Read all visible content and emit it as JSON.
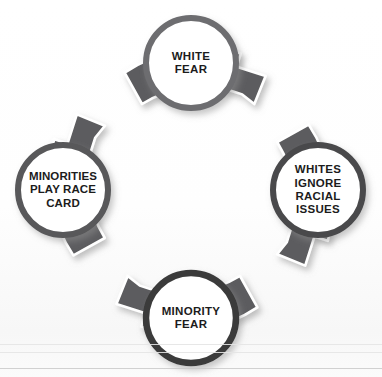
{
  "diagram": {
    "type": "cycle",
    "direction": "clockwise",
    "title": "",
    "colors": {
      "arrow_fill": "#5c5c5e",
      "arrow_outline": "#ffffff",
      "circle_ring": "#6a6a6c",
      "circle_ring_dark": "#3b3b3b",
      "circle_fill": "#ffffff",
      "text": "#1c1c1c",
      "background": "#ffffff",
      "scan_rule": "#c9c9c9"
    },
    "nodes": [
      {
        "id": "white-fear",
        "position": "top",
        "lines": [
          "WHITE",
          "FEAR"
        ]
      },
      {
        "id": "whites-ignore-racial-issues",
        "position": "right",
        "lines": [
          "WHITES",
          "IGNORE",
          "RACIAL",
          "ISSUES"
        ]
      },
      {
        "id": "minority-fear",
        "position": "bottom",
        "lines": [
          "MINORITY",
          "FEAR"
        ]
      },
      {
        "id": "minorities-play-race-card",
        "position": "left",
        "lines": [
          "MINORITIES",
          "PLAY RACE",
          "CARD"
        ]
      }
    ],
    "arrows": [
      {
        "id": "arrow-top-to-right",
        "from": "white-fear",
        "to": "whites-ignore-racial-issues"
      },
      {
        "id": "arrow-right-to-bottom",
        "from": "whites-ignore-racial-issues",
        "to": "minority-fear"
      },
      {
        "id": "arrow-bottom-to-left",
        "from": "minority-fear",
        "to": "minorities-play-race-card"
      },
      {
        "id": "arrow-left-to-top",
        "from": "minorities-play-race-card",
        "to": "white-fear"
      }
    ]
  }
}
